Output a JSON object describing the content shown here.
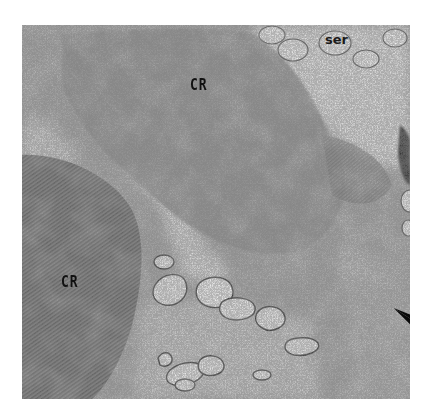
{
  "figure": {
    "type": "electron-micrograph",
    "labels": [
      {
        "id": "cr_upper",
        "text": "CR",
        "x": 190,
        "y": 78
      },
      {
        "id": "cr_lower",
        "text": "CR",
        "x": 61,
        "y": 275
      },
      {
        "id": "ser",
        "text": "ser",
        "x": 324,
        "y": 33
      }
    ],
    "arrowheads": [
      {
        "id": "arrow_1",
        "tip_x": 317,
        "tip_y": 212,
        "direction": "down-left"
      },
      {
        "id": "arrow_2",
        "tip_x": 377,
        "tip_y": 254,
        "direction": "down-right"
      }
    ],
    "colors": {
      "background": "#ffffff",
      "cytoplasm": "#a8a8a8",
      "crystalline_region": "#7e7e7e",
      "vesicle": "#efefef",
      "arrowhead": "#0a0a0a"
    }
  }
}
